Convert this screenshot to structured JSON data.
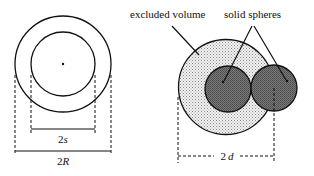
{
  "left_diagram": {
    "inner_diameter_label": "2s",
    "outer_diameter_label": "2R",
    "inner_diameter_prefix": "2",
    "inner_diameter_var": "s",
    "outer_diameter_prefix": "2",
    "outer_diameter_var": "R"
  },
  "right_diagram": {
    "excluded_volume_label": "excluded volume",
    "solid_spheres_label": "solid spheres",
    "distance_label": "2d",
    "distance_prefix": "2",
    "distance_var": "d"
  },
  "colors": {
    "stroke": "#111111",
    "excluded_volume_fill": "#e2e2e2",
    "sphere_fill": "#6e6e6e",
    "background": "#ffffff"
  }
}
